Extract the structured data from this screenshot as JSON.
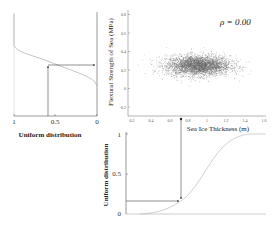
{
  "figure": {
    "left_panel": {
      "xlabel": "Uniform distribution",
      "ticks": [
        "1",
        "0.5",
        "0"
      ],
      "description": "Rotated CDF of flexural strength"
    },
    "scatter_panel": {
      "ylabel": "Flexural Strength of Sea (MPa)",
      "xlabel": "Sea Ice Thickness (m)",
      "annotation": "ρ = 0.00",
      "xticks": [
        "0.2",
        "0.4",
        "0.6",
        "0.8",
        "1",
        "1.2",
        "1.4",
        "1.6"
      ],
      "yticks": [
        "0.8",
        "0.6",
        "0.4",
        "0.2",
        "0",
        "-0.2"
      ]
    },
    "bottom_panel": {
      "ylabel": "Uniform distribution",
      "ticks": [
        "1",
        "0.5",
        "0"
      ],
      "description": "CDF of sea ice thickness"
    }
  },
  "chart_data": [
    {
      "type": "scatter",
      "title": "",
      "annotation": "ρ = 0.00",
      "xlabel": "Sea Ice Thickness (m)",
      "ylabel": "Flexural Strength of Sea (MPa)",
      "xlim": [
        0.2,
        1.6
      ],
      "ylim": [
        -0.2,
        0.8
      ],
      "xticks": [
        0.2,
        0.4,
        0.6,
        0.8,
        1,
        1.2,
        1.4,
        1.6
      ],
      "yticks": [
        -0.2,
        0,
        0.2,
        0.4,
        0.6,
        0.8
      ],
      "cloud": {
        "x_center": 0.9,
        "y_center": 0.25,
        "x_range": [
          0.35,
          1.4
        ],
        "y_range": [
          0.08,
          0.42
        ]
      },
      "correlation": 0.0
    },
    {
      "type": "line",
      "name": "CDF of flexural strength (rotated)",
      "xlabel": "Uniform distribution",
      "x": [
        0,
        0.5,
        1
      ],
      "note": "horizontal axis reversed: 1 at left, 0 at right"
    },
    {
      "type": "line",
      "name": "CDF of sea ice thickness",
      "ylabel": "Uniform distribution",
      "yticks": [
        0,
        0.5,
        1
      ],
      "points": [
        [
          0.3,
          0
        ],
        [
          0.5,
          0.02
        ],
        [
          0.8,
          0.15
        ],
        [
          1.0,
          0.5
        ],
        [
          1.2,
          0.88
        ],
        [
          1.4,
          1.0
        ],
        [
          1.6,
          1.0
        ]
      ]
    }
  ]
}
